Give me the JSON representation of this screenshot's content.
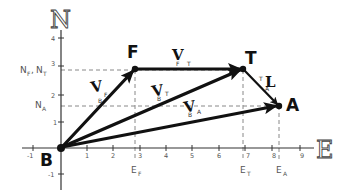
{
  "axes": {
    "north_label": "N",
    "east_label": "E",
    "east_ticks": [
      "-1",
      "1",
      "2",
      "3",
      "4",
      "5",
      "6",
      "7",
      "8",
      "9"
    ],
    "north_ticks": [
      "4",
      "3",
      "2",
      "1",
      "-1"
    ]
  },
  "points": {
    "B": {
      "label": "B",
      "e": 0,
      "n": 0
    },
    "F": {
      "label": "F",
      "e": 2.8,
      "n": 2.9
    },
    "T": {
      "label": "T",
      "e": 6.9,
      "n": 2.9
    },
    "A": {
      "label": "A",
      "e": 8.2,
      "n": 1.5
    }
  },
  "vectors": [
    {
      "name": "V_BF",
      "main": "V",
      "sub_left": "B",
      "sub_right": "F",
      "from": "B",
      "to": "F"
    },
    {
      "name": "V_FT",
      "main": "V",
      "sub_left": "F",
      "sub_right": "T",
      "from": "F",
      "to": "T"
    },
    {
      "name": "V_BT",
      "main": "V",
      "sub_left": "B",
      "sub_right": "T",
      "from": "B",
      "to": "T"
    },
    {
      "name": "V_BA",
      "main": "V",
      "sub_left": "B",
      "sub_right": "A",
      "from": "B",
      "to": "A"
    },
    {
      "name": "L_TA",
      "main": "L",
      "sub_left": "T",
      "sub_right": "A",
      "from": "T",
      "to": "A"
    }
  ],
  "reference_labels": {
    "N_F_N_T": {
      "main1": "N",
      "sub1": "F",
      "sep": ",",
      "main2": "N",
      "sub2": "T"
    },
    "N_A": {
      "main": "N",
      "sub": "A"
    },
    "E_F": {
      "main": "E",
      "sub": "F"
    },
    "E_T": {
      "main": "E",
      "sub": "T"
    },
    "E_A": {
      "main": "E",
      "sub": "A"
    }
  }
}
